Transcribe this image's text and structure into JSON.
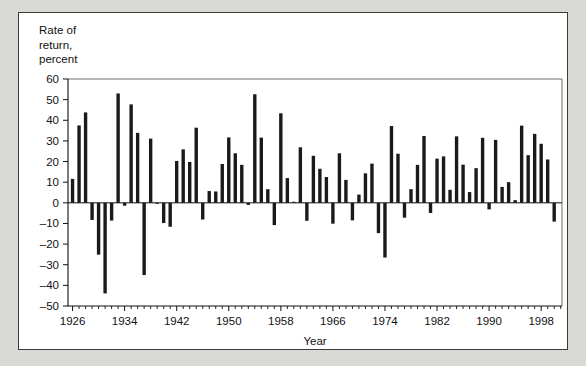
{
  "figure": {
    "background": "#ffffff",
    "page_background": "#d9d9d6",
    "border_color": "#3a3a3a",
    "bar_color": "#1a1a1a"
  },
  "axis_title_block": "Rate of\nreturn,\npercent",
  "chart_data": {
    "type": "bar",
    "title": "",
    "subtitle": "",
    "xlabel": "Year",
    "ylabel": "Rate of return, percent",
    "ylim": [
      -50,
      60
    ],
    "ytick_step": 10,
    "yticks": [
      -50,
      -40,
      -30,
      -20,
      -10,
      0,
      10,
      20,
      30,
      40,
      50,
      60
    ],
    "ytick_labels": [
      "–50",
      "–40",
      "–30",
      "–20",
      "–10",
      "0",
      "10",
      "20",
      "30",
      "40",
      "50",
      "60"
    ],
    "xlim": [
      1925.3,
      2001.2
    ],
    "xtick_labels": [
      "1926",
      "1934",
      "1942",
      "1950",
      "1958",
      "1966",
      "1974",
      "1982",
      "1990",
      "1998"
    ],
    "xtick_values": [
      1926,
      1934,
      1942,
      1950,
      1958,
      1966,
      1974,
      1982,
      1990,
      1998
    ],
    "xtick_minor_step": 1,
    "grid": false,
    "legend": null,
    "categories": [
      1926,
      1927,
      1928,
      1929,
      1930,
      1931,
      1932,
      1933,
      1934,
      1935,
      1936,
      1937,
      1938,
      1939,
      1940,
      1941,
      1942,
      1943,
      1944,
      1945,
      1946,
      1947,
      1948,
      1949,
      1950,
      1951,
      1952,
      1953,
      1954,
      1955,
      1956,
      1957,
      1958,
      1959,
      1960,
      1961,
      1962,
      1963,
      1964,
      1965,
      1966,
      1967,
      1968,
      1969,
      1970,
      1971,
      1972,
      1973,
      1974,
      1975,
      1976,
      1977,
      1978,
      1979,
      1980,
      1981,
      1982,
      1983,
      1984,
      1985,
      1986,
      1987,
      1988,
      1989,
      1990,
      1991,
      1992,
      1993,
      1994,
      1995,
      1996,
      1997,
      1998,
      1999,
      2000
    ],
    "values": [
      11.6,
      37.5,
      43.8,
      -8.3,
      -25.1,
      -43.9,
      -8.6,
      53.0,
      -1.4,
      47.7,
      33.9,
      -35.0,
      31.1,
      -0.4,
      -9.8,
      -11.6,
      20.3,
      25.9,
      19.8,
      36.4,
      -8.1,
      5.7,
      5.5,
      18.8,
      31.7,
      24.0,
      18.4,
      -1.0,
      52.6,
      31.6,
      6.6,
      -10.8,
      43.4,
      12.0,
      0.5,
      26.9,
      -8.7,
      22.8,
      16.5,
      12.5,
      -10.1,
      24.0,
      11.1,
      -8.5,
      4.0,
      14.3,
      19.0,
      -14.7,
      -26.5,
      37.2,
      23.8,
      -7.2,
      6.6,
      18.4,
      32.4,
      -4.9,
      21.4,
      22.5,
      6.3,
      32.2,
      18.5,
      5.2,
      16.8,
      31.5,
      -3.2,
      30.5,
      7.7,
      10.0,
      1.3,
      37.4,
      23.1,
      33.4,
      28.6,
      21.0,
      -9.1
    ]
  },
  "axis_name_x": "Year"
}
